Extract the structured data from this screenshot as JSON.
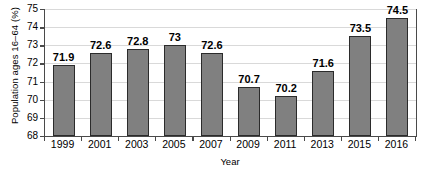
{
  "chart_data": {
    "type": "bar",
    "title": "",
    "xlabel": "Year",
    "ylabel": "Population ages 16–64 (%)",
    "categories": [
      "1999",
      "2001",
      "2003",
      "2005",
      "2007",
      "2009",
      "2011",
      "2013",
      "2015",
      "2016"
    ],
    "values": [
      71.9,
      72.6,
      72.8,
      73,
      72.6,
      70.7,
      70.2,
      71.6,
      73.5,
      74.5
    ],
    "data_labels": [
      "71.9",
      "72.6",
      "72.8",
      "73",
      "72.6",
      "70.7",
      "70.2",
      "71.6",
      "73.5",
      "74.5"
    ],
    "ylim": [
      68,
      75
    ],
    "ytick_labels": [
      "68",
      "69",
      "70",
      "71",
      "72",
      "73",
      "74",
      "75"
    ],
    "ytick_values": [
      68,
      69,
      70,
      71,
      72,
      73,
      74,
      75
    ],
    "grid": "horizontal",
    "legend": "none",
    "bar_color": "#808080",
    "bar_edge_color": "#2b2b2b",
    "grid_color": "#d9d9d9",
    "axis_color": "#4a4a4a",
    "background": "#ffffff"
  }
}
